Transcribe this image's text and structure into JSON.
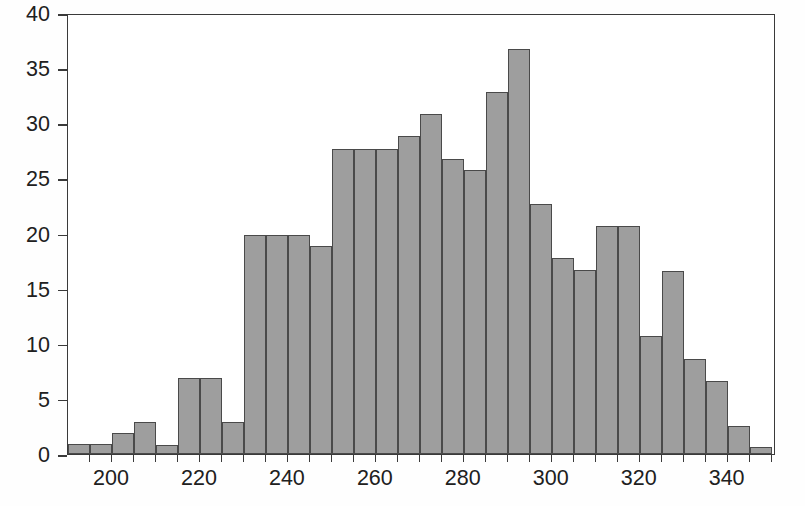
{
  "chart_data": {
    "type": "bar",
    "chart_subtype": "histogram",
    "title": "",
    "subtitle": "",
    "xlabel": "",
    "ylabel": "",
    "xlim": [
      190,
      351
    ],
    "ylim": [
      0,
      40
    ],
    "grid": false,
    "legend": null,
    "bin_width": 5,
    "bar_color": "#9e9e9e",
    "bar_edge_color": "#4a4a4a",
    "axis_color": "#3a3a3a",
    "x_ticks": [
      200,
      220,
      240,
      260,
      280,
      300,
      320,
      340
    ],
    "x_minor_tick_step": 5,
    "y_ticks": [
      0,
      5,
      10,
      15,
      20,
      25,
      30,
      35,
      40
    ],
    "x_tick_labels": [
      "200",
      "220",
      "240",
      "260",
      "280",
      "300",
      "320",
      "340"
    ],
    "y_tick_labels": [
      "0",
      "5",
      "10",
      "15",
      "20",
      "25",
      "30",
      "35",
      "40"
    ],
    "bins": [
      {
        "x0": 190,
        "x1": 195,
        "value": 0.9
      },
      {
        "x0": 195,
        "x1": 200,
        "value": 0.9
      },
      {
        "x0": 200,
        "x1": 205,
        "value": 1.9
      },
      {
        "x0": 205,
        "x1": 210,
        "value": 2.9
      },
      {
        "x0": 210,
        "x1": 215,
        "value": 0.8
      },
      {
        "x0": 215,
        "x1": 220,
        "value": 6.9
      },
      {
        "x0": 220,
        "x1": 225,
        "value": 6.9
      },
      {
        "x0": 225,
        "x1": 230,
        "value": 2.9
      },
      {
        "x0": 230,
        "x1": 235,
        "value": 19.9
      },
      {
        "x0": 235,
        "x1": 240,
        "value": 19.9
      },
      {
        "x0": 240,
        "x1": 245,
        "value": 19.9
      },
      {
        "x0": 245,
        "x1": 250,
        "value": 18.9
      },
      {
        "x0": 250,
        "x1": 255,
        "value": 27.7
      },
      {
        "x0": 255,
        "x1": 260,
        "value": 27.7
      },
      {
        "x0": 260,
        "x1": 265,
        "value": 27.7
      },
      {
        "x0": 265,
        "x1": 270,
        "value": 28.8
      },
      {
        "x0": 270,
        "x1": 275,
        "value": 30.8
      },
      {
        "x0": 275,
        "x1": 280,
        "value": 26.8
      },
      {
        "x0": 280,
        "x1": 285,
        "value": 25.8
      },
      {
        "x0": 285,
        "x1": 290,
        "value": 32.8
      },
      {
        "x0": 290,
        "x1": 295,
        "value": 36.7
      },
      {
        "x0": 295,
        "x1": 300,
        "value": 22.7
      },
      {
        "x0": 300,
        "x1": 305,
        "value": 17.8
      },
      {
        "x0": 305,
        "x1": 310,
        "value": 16.7
      },
      {
        "x0": 310,
        "x1": 315,
        "value": 20.7
      },
      {
        "x0": 315,
        "x1": 320,
        "value": 20.7
      },
      {
        "x0": 320,
        "x1": 325,
        "value": 10.7
      },
      {
        "x0": 325,
        "x1": 330,
        "value": 16.6
      },
      {
        "x0": 330,
        "x1": 335,
        "value": 8.6
      },
      {
        "x0": 335,
        "x1": 340,
        "value": 6.6
      },
      {
        "x0": 340,
        "x1": 345,
        "value": 2.5
      },
      {
        "x0": 345,
        "x1": 350,
        "value": 0.6
      }
    ]
  }
}
